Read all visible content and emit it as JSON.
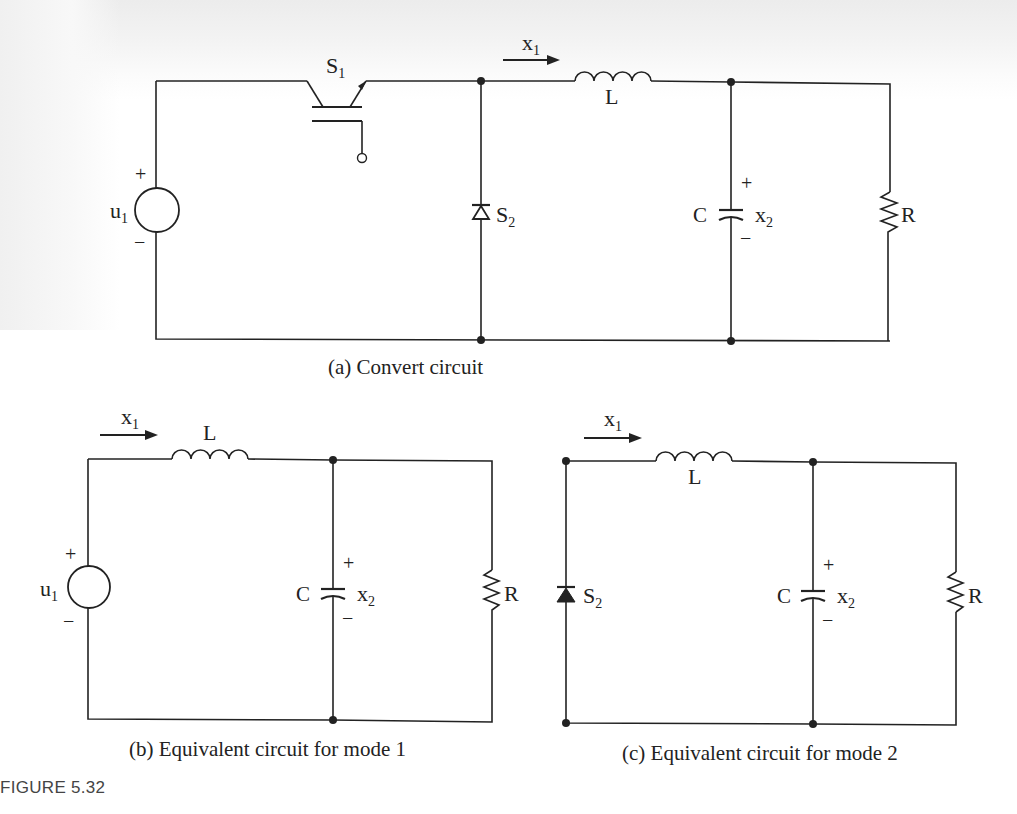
{
  "figure": {
    "number_label": "FIGURE 5.32"
  },
  "circuit_a": {
    "caption": "(a) Convert circuit",
    "source": {
      "name": "u",
      "sub": "1",
      "plus": "+",
      "minus": "−"
    },
    "switch": {
      "name": "S",
      "sub": "1",
      "type": "IGBT"
    },
    "diode": {
      "name": "S",
      "sub": "2",
      "fill": "hollow"
    },
    "current": {
      "name": "x",
      "sub": "1"
    },
    "inductor": {
      "name": "L"
    },
    "capacitor": {
      "name": "C",
      "voltage": "x",
      "voltage_sub": "2",
      "plus": "+",
      "minus": "−"
    },
    "resistor": {
      "name": "R"
    }
  },
  "circuit_b": {
    "caption": "(b) Equivalent circuit for mode 1",
    "source": {
      "name": "u",
      "sub": "1",
      "plus": "+",
      "minus": "−"
    },
    "current": {
      "name": "x",
      "sub": "1"
    },
    "inductor": {
      "name": "L"
    },
    "capacitor": {
      "name": "C",
      "voltage": "x",
      "voltage_sub": "2",
      "plus": "+",
      "minus": "−"
    },
    "resistor": {
      "name": "R"
    }
  },
  "circuit_c": {
    "caption": "(c) Equivalent circuit for mode 2",
    "diode": {
      "name": "S",
      "sub": "2",
      "fill": "solid"
    },
    "current": {
      "name": "x",
      "sub": "1"
    },
    "inductor": {
      "name": "L"
    },
    "capacitor": {
      "name": "C",
      "voltage": "x",
      "voltage_sub": "2",
      "plus": "+",
      "minus": "−"
    },
    "resistor": {
      "name": "R"
    }
  },
  "colors": {
    "ink": "#222222",
    "background": "#ffffff",
    "figure_label": "#444444"
  }
}
